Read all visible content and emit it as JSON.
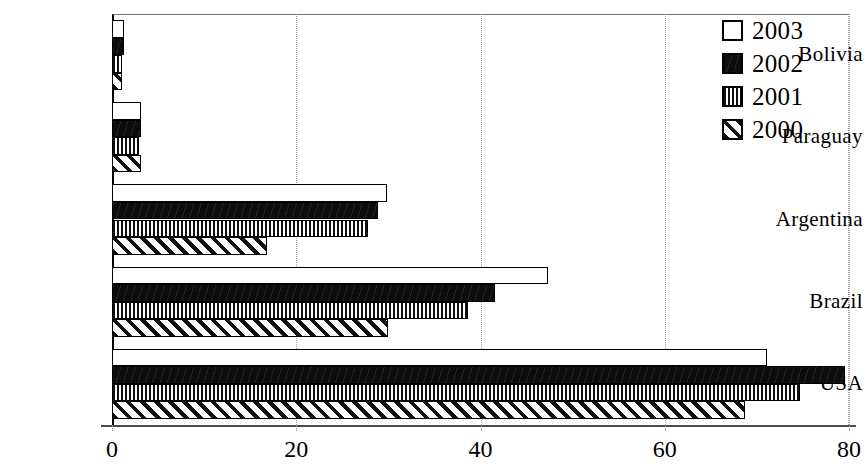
{
  "chart_data": {
    "type": "bar",
    "orientation": "horizontal",
    "title": "",
    "subtitle": "",
    "xlabel": "",
    "ylabel": "",
    "xlim": [
      0,
      80
    ],
    "xticks": [
      0,
      20,
      40,
      60,
      80
    ],
    "xtick_labels": [
      "0",
      "20",
      "40",
      "60",
      "80"
    ],
    "grid": "vertical-dotted",
    "legend_position": "top-right",
    "categories": [
      "Bolivia",
      "Paraguay",
      "Argentina",
      "Brazil",
      "USA"
    ],
    "series": [
      {
        "name": "2003",
        "pattern": "solid-white",
        "color": "#ffffff",
        "values": [
          1.3,
          3.2,
          29.8,
          47.3,
          71.1
        ]
      },
      {
        "name": "2002",
        "pattern": "solid-black",
        "color": "#0c0c0c",
        "values": [
          1.3,
          3.1,
          28.9,
          41.6,
          79.6
        ]
      },
      {
        "name": "2001",
        "pattern": "vertical",
        "color": "#111111",
        "values": [
          1.1,
          2.9,
          27.8,
          38.6,
          74.7
        ]
      },
      {
        "name": "2000",
        "pattern": "diagonal",
        "color": "#111111",
        "values": [
          1.1,
          3.1,
          16.8,
          30.0,
          68.7
        ]
      }
    ]
  },
  "legend": {
    "items": [
      {
        "label": "2003",
        "pattern": "solid-white"
      },
      {
        "label": "2002",
        "pattern": "solid-black"
      },
      {
        "label": "2001",
        "pattern": "vertical"
      },
      {
        "label": "2000",
        "pattern": "diagonal"
      }
    ]
  },
  "axis": {
    "x_tick_labels": [
      "0",
      "20",
      "40",
      "60",
      "80"
    ],
    "category_labels": [
      "Bolivia",
      "Paraguay",
      "Argentina",
      "Brazil",
      "USA"
    ]
  }
}
